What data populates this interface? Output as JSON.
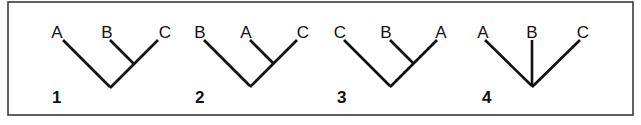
{
  "figure": {
    "frame": {
      "x": 8,
      "y": 2,
      "width": 625,
      "height": 113
    },
    "colors": {
      "line": "#111111",
      "frame": "#3a3a3a",
      "background": "#ffffff"
    }
  },
  "trees": [
    {
      "number": "1",
      "number_pos": [
        52,
        103
      ],
      "topology": "(A,(B,C))",
      "taxa": [
        {
          "label": "A",
          "x": 57,
          "y": 38,
          "tip": [
            63,
            40
          ]
        },
        {
          "label": "B",
          "x": 107,
          "y": 38,
          "tip": [
            110,
            40
          ]
        },
        {
          "label": "C",
          "x": 165,
          "y": 38,
          "tip": [
            158,
            40
          ]
        }
      ],
      "root": [
        110,
        87
      ],
      "internal": [
        134,
        63
      ],
      "edges": [
        [
          0,
          "root"
        ],
        [
          1,
          "internal"
        ],
        [
          2,
          "internal"
        ],
        [
          "internal",
          "root"
        ]
      ]
    },
    {
      "number": "2",
      "number_pos": [
        195,
        103
      ],
      "topology": "(B,(A,C))",
      "taxa": [
        {
          "label": "B",
          "x": 200,
          "y": 38,
          "tip": [
            204,
            40
          ]
        },
        {
          "label": "A",
          "x": 246,
          "y": 38,
          "tip": [
            250,
            40
          ]
        },
        {
          "label": "C",
          "x": 303,
          "y": 38,
          "tip": [
            297,
            40
          ]
        }
      ],
      "root": [
        250,
        86
      ],
      "internal": [
        273,
        63
      ],
      "edges": [
        [
          0,
          "root"
        ],
        [
          1,
          "internal"
        ],
        [
          2,
          "internal"
        ],
        [
          "internal",
          "root"
        ]
      ]
    },
    {
      "number": "3",
      "number_pos": [
        337,
        103
      ],
      "topology": "(C,(B,A))",
      "taxa": [
        {
          "label": "C",
          "x": 340,
          "y": 38,
          "tip": [
            344,
            40
          ]
        },
        {
          "label": "B",
          "x": 386,
          "y": 38,
          "tip": [
            390,
            40
          ]
        },
        {
          "label": "A",
          "x": 441,
          "y": 38,
          "tip": [
            437,
            40
          ]
        }
      ],
      "root": [
        390,
        86
      ],
      "internal": [
        413,
        63
      ],
      "edges": [
        [
          0,
          "root"
        ],
        [
          1,
          "internal"
        ],
        [
          2,
          "internal"
        ],
        [
          "internal",
          "root"
        ]
      ]
    },
    {
      "number": "4",
      "number_pos": [
        482,
        103
      ],
      "topology": "(A,B,C)",
      "taxa": [
        {
          "label": "A",
          "x": 483,
          "y": 38,
          "tip": [
            485,
            40
          ]
        },
        {
          "label": "B",
          "x": 532,
          "y": 38,
          "tip": [
            532,
            40
          ]
        },
        {
          "label": "C",
          "x": 583,
          "y": 38,
          "tip": [
            580,
            40
          ]
        }
      ],
      "root": [
        532,
        86
      ],
      "internal": null,
      "edges": [
        [
          0,
          "root"
        ],
        [
          1,
          "root"
        ],
        [
          2,
          "root"
        ]
      ]
    }
  ]
}
